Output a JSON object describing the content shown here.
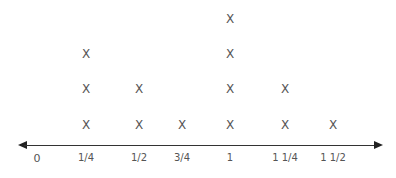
{
  "chart_data": {
    "type": "scatter",
    "subtype": "line_plot",
    "title": "",
    "xlabel": "",
    "ylabel": "",
    "marker": "X",
    "categories": [
      "0",
      "1/4",
      "1/2",
      "3/4",
      "1",
      "1 1/4",
      "1 1/2"
    ],
    "values": [
      0,
      3,
      2,
      1,
      4,
      2,
      1
    ],
    "x_numeric": [
      0,
      0.25,
      0.5,
      0.75,
      1,
      1.25,
      1.5
    ],
    "grid": false,
    "axis_arrows": true
  },
  "labels": {
    "t0": "0",
    "t1": "1/4",
    "t2": "1/2",
    "t3": "3/4",
    "t4": "1",
    "t5": "1 1/4",
    "t6": "1 1/2"
  },
  "mark_symbol": "X"
}
